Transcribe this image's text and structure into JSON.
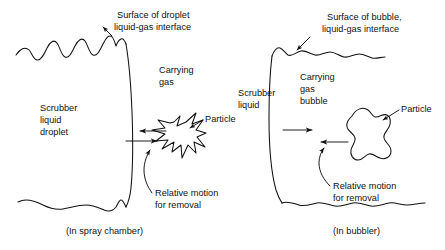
{
  "figure": {
    "title": "",
    "panels": [
      {
        "id": "left",
        "caption": "(In spray chamber)",
        "labels": {
          "surface": "Surface of droplet\nliquid-gas interface",
          "surface_line1": "Surface of droplet",
          "surface_line2": "liquid-gas interface",
          "liquid_line1": "Scrubber",
          "liquid_line2": "liquid",
          "liquid_line3": "droplet",
          "gas_line1": "Carrying",
          "gas_line2": "gas",
          "particle": "Particle",
          "motion_line1": "Relative motion",
          "motion_line2": "for removal"
        }
      },
      {
        "id": "right",
        "caption": "(In bubbler)",
        "labels": {
          "surface_line1": "Surface of bubble,",
          "surface_line2": "liquid-gas interface",
          "liquid_line1": "Scrubber",
          "liquid_line2": "liquid",
          "gas_line1": "Carrying",
          "gas_line2": "gas",
          "gas_line3": "bubble",
          "particle": "Particle",
          "motion_line1": "Relative motion",
          "motion_line2": "for removal"
        }
      }
    ],
    "colors": {
      "ink": "#111111",
      "background": "#ffffff"
    }
  }
}
